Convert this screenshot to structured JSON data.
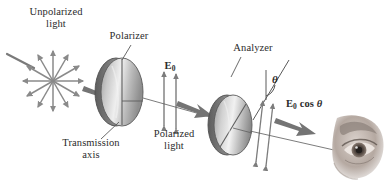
{
  "figure": {
    "background_color": "#ffffff",
    "ink_color": "#2b2b2b",
    "width": 388,
    "height": 190
  },
  "labels": {
    "unpolarized_light": "Unpolarized\nlight",
    "polarizer": "Polarizer",
    "analyzer": "Analyzer",
    "e_zero": "E",
    "e_zero_sub": "0",
    "theta": "θ",
    "e_zero_cos_theta_field": "E",
    "e_zero_cos_theta_sub": "0",
    "e_zero_cos_theta_rest": " cos ",
    "e_zero_cos_theta_angle": "θ",
    "transmission_axis": "Transmission\naxis",
    "polarized_light": "Polarized\nlight"
  },
  "elements": {
    "unpolarized_burst": {
      "name": "unpolarized-light-starburst",
      "center_x": 53,
      "center_y": 81,
      "ray_count": 12,
      "radius": 30
    },
    "incoming_ray": {
      "name": "incoming-light-ray",
      "x1": 8,
      "y1": 55,
      "x2": 36,
      "y2": 69
    },
    "polarizer_disk": {
      "name": "polarizer-disk",
      "cx": 122,
      "cy": 92,
      "rx": 21,
      "ry": 34,
      "axis": "vertical",
      "fill_light": "#e8e8e8",
      "fill_dark": "#8d8d8d",
      "edge": "#6f6f6f"
    },
    "analyzer_disk": {
      "name": "analyzer-disk",
      "cx": 233,
      "cy": 125,
      "rx": 19,
      "ry": 30,
      "axis": "diagonal",
      "fill_light": "#ececec",
      "fill_dark": "#909090",
      "edge": "#6f6f6f"
    },
    "propagation_arrow_1": {
      "name": "propagation-arrow-after-source",
      "from_x": 86,
      "from_y": 88,
      "to_x": 112,
      "to_y": 99
    },
    "propagation_arrow_2": {
      "name": "propagation-arrow-after-polarizer",
      "from_x": 176,
      "from_y": 105,
      "to_x": 212,
      "to_y": 120
    },
    "propagation_arrow_3": {
      "name": "propagation-arrow-to-eye",
      "from_x": 278,
      "from_y": 125,
      "to_x": 330,
      "to_y": 137
    },
    "e0_field_arrows": {
      "name": "e0-field-double-arrows",
      "count": 2,
      "x_positions": [
        164,
        176
      ],
      "top_y": 71,
      "bottom_y": 127
    },
    "transmitted_field_arrows": {
      "name": "transmitted-field-double-arrows",
      "count": 2,
      "x_positions": [
        258,
        268
      ],
      "top_y": 100,
      "bottom_y": 165
    },
    "analyzer_axis_line": {
      "name": "analyzer-transmission-axis-line",
      "x1": 286,
      "y1": 63,
      "x2": 256,
      "y2": 115
    },
    "leader_polarizer": {
      "name": "leader-line-polarizer",
      "x1": 130,
      "y1": 46,
      "x2": 122,
      "y2": 60
    },
    "leader_analyzer": {
      "name": "leader-line-analyzer",
      "x1": 240,
      "y1": 58,
      "x2": 232,
      "y2": 76
    },
    "leader_transmission": {
      "name": "leader-line-transmission-axis",
      "x1": 118,
      "y1": 121,
      "x2": 102,
      "y2": 140
    },
    "eye": {
      "name": "observer-eye",
      "cx": 360,
      "cy": 145,
      "width": 52,
      "height": 62
    }
  },
  "colors": {
    "ink": "#2b2b2b",
    "arrow_gray": "#7c7c7c",
    "arrow_dark_gray": "#6a6a6a",
    "burst_gray": "#8a8a8a",
    "disk_edge": "#636363",
    "disk_light": "#ececec",
    "disk_mid": "#b5b5b5",
    "disk_dark": "#848484",
    "line_thin": "#5a5a5a",
    "eye_skin": "#b9ada6",
    "eye_shadow": "#6d625c"
  }
}
